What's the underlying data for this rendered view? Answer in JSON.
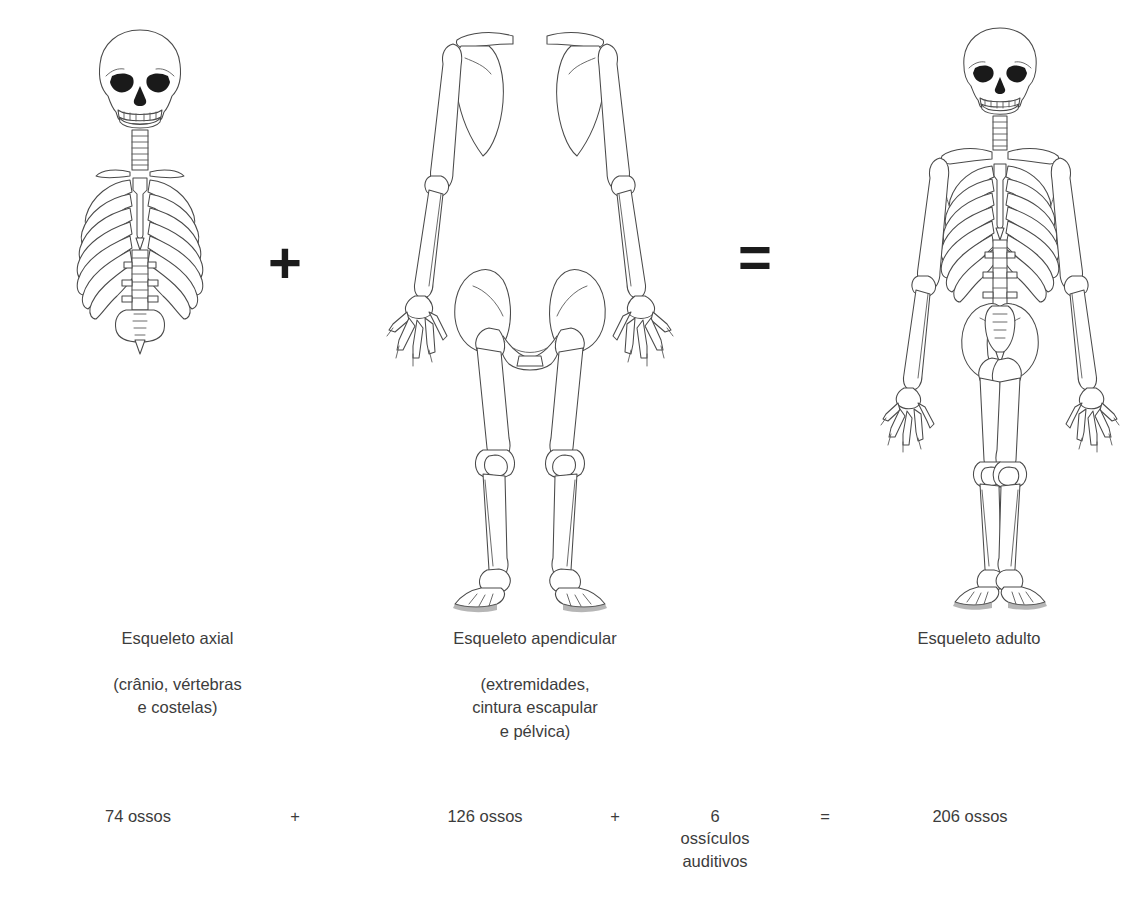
{
  "diagram": {
    "type": "anatomical-equation",
    "language": "pt-BR",
    "background_color": "#ffffff",
    "line_color": "#4a4a4a",
    "text_color": "#3c3c3c"
  },
  "columns": [
    {
      "id": "axial",
      "figure_name": "axial-skeleton-illustration",
      "title": "Esqueleto axial",
      "subtitle": "(crânio, vértebras\ne costelas)",
      "bone_count": "74 ossos"
    },
    {
      "id": "appendicular",
      "figure_name": "appendicular-skeleton-illustration",
      "title": "Esqueleto apendicular",
      "subtitle": "(extremidades,\ncintura escapular\ne pélvica)",
      "bone_count": "126 ossos"
    },
    {
      "id": "adult",
      "figure_name": "adult-skeleton-illustration",
      "title": "Esqueleto adulto",
      "subtitle": "",
      "bone_count": "206 ossos"
    }
  ],
  "operators": {
    "figure_plus": "+",
    "figure_equals": "=",
    "eq_plus_1": "+",
    "eq_plus_2": "+",
    "eq_equals": "="
  },
  "equation": {
    "axial_bones": "74 ossos",
    "appendicular_bones": "126 ossos",
    "ossicles": "6\nossículos\nauditivos",
    "total_bones": "206 ossos"
  }
}
